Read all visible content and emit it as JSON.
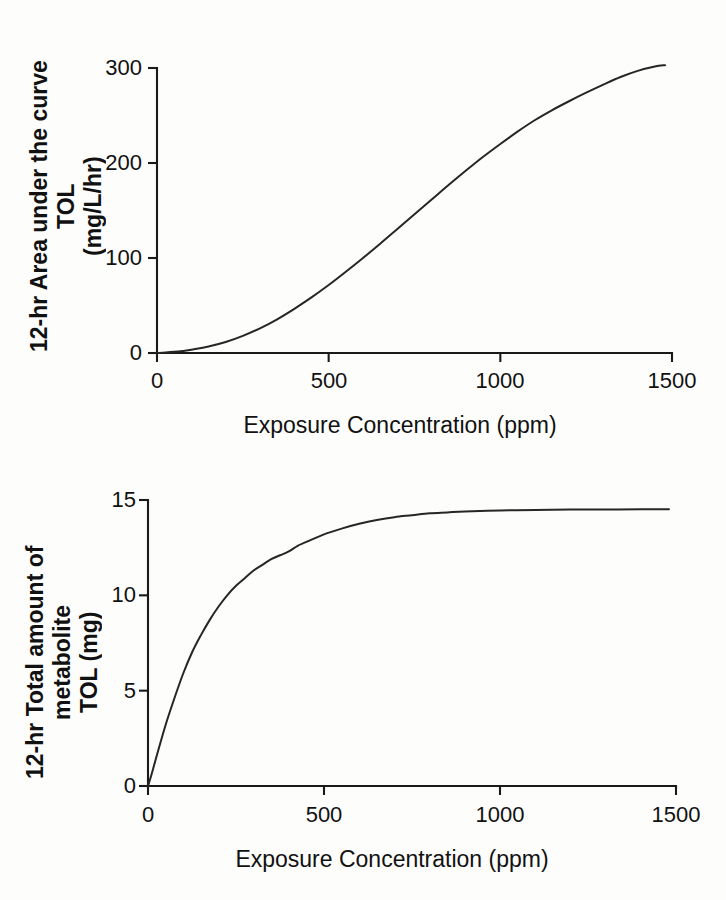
{
  "document": {
    "type": "scanned-figure-page",
    "background_color": "#fdfdfc",
    "ink_color": "#1a1a1a",
    "bleed_through_text": " "
  },
  "chart_data": [
    {
      "id": "auc-tol",
      "type": "line",
      "title": "",
      "xlabel": "Exposure Concentration (ppm)",
      "ylabel": "12-hr Area under the curve TOL (mg/L/hr)",
      "ylabel_line1": "12-hr Area under the curve TOL",
      "ylabel_line2": "(mg/L/hr)",
      "xlim": [
        0,
        1500
      ],
      "ylim": [
        0,
        300
      ],
      "xticks": [
        0,
        500,
        1000,
        1500
      ],
      "xtick_labels": [
        "0",
        "500",
        "1000",
        "1500"
      ],
      "yticks": [
        0,
        100,
        200,
        300
      ],
      "ytick_labels": [
        "0",
        "100",
        "200",
        "300"
      ],
      "grid": false,
      "legend": false,
      "series": [
        {
          "name": "12-hr AUC TOL",
          "x": [
            0,
            25,
            50,
            75,
            100,
            150,
            200,
            250,
            300,
            350,
            400,
            450,
            500,
            550,
            600,
            650,
            700,
            750,
            800,
            850,
            900,
            950,
            1000,
            1050,
            1100,
            1150,
            1200,
            1250,
            1300,
            1350,
            1400,
            1450,
            1480
          ],
          "y": [
            0,
            0.5,
            1.2,
            2.2,
            3.4,
            6.8,
            11.5,
            18.0,
            26.0,
            35.5,
            46.5,
            58.5,
            71.5,
            85.5,
            100.0,
            115.0,
            130.5,
            146.0,
            161.5,
            177.0,
            192.0,
            206.5,
            220.0,
            233.0,
            245.0,
            255.5,
            265.0,
            274.0,
            282.5,
            290.5,
            297.0,
            301.5,
            303.0
          ]
        }
      ]
    },
    {
      "id": "metabolite-tol",
      "type": "line",
      "title": "",
      "xlabel": "Exposure Concentration (ppm)",
      "ylabel": "12-hr Total amount of metabolite TOL (mg)",
      "ylabel_line1": "12-hr Total amount of metabolite",
      "ylabel_line2": "TOL (mg)",
      "xlim": [
        0,
        1500
      ],
      "ylim": [
        0,
        15
      ],
      "xticks": [
        0,
        500,
        1000,
        1500
      ],
      "xtick_labels": [
        "0",
        "500",
        "1000",
        "1500"
      ],
      "yticks": [
        0,
        5,
        10,
        15
      ],
      "ytick_labels": [
        "0",
        "5",
        "10",
        "15"
      ],
      "grid": false,
      "legend": false,
      "series": [
        {
          "name": "12-hr total metabolite TOL",
          "x": [
            0,
            10,
            25,
            50,
            75,
            100,
            125,
            150,
            175,
            200,
            225,
            250,
            275,
            300,
            325,
            350,
            375,
            400,
            425,
            450,
            500,
            550,
            600,
            650,
            700,
            750,
            800,
            850,
            900,
            1000,
            1100,
            1200,
            1300,
            1400,
            1480
          ],
          "y": [
            0,
            0.6,
            1.6,
            3.2,
            4.6,
            5.9,
            7.0,
            7.9,
            8.7,
            9.4,
            10.0,
            10.5,
            10.9,
            11.3,
            11.6,
            11.9,
            12.1,
            12.3,
            12.6,
            12.8,
            13.2,
            13.5,
            13.75,
            13.95,
            14.1,
            14.2,
            14.3,
            14.35,
            14.4,
            14.45,
            14.48,
            14.5,
            14.5,
            14.52,
            14.52
          ]
        }
      ]
    }
  ]
}
